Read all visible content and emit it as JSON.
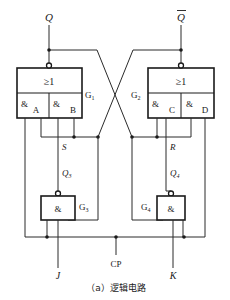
{
  "outputs": {
    "q": "Q",
    "q_bar": "Q"
  },
  "gates": {
    "g1": {
      "label": "G",
      "sub": "1",
      "or_symbol": "≥1",
      "and_left": "&",
      "and_right": "&",
      "input_a": "A",
      "input_b": "B"
    },
    "g2": {
      "label": "G",
      "sub": "2",
      "or_symbol": "≥1",
      "and_left": "&",
      "and_right": "&",
      "input_c": "C",
      "input_d": "D"
    },
    "g3": {
      "label": "G",
      "sub": "3",
      "symbol": "&"
    },
    "g4": {
      "label": "G",
      "sub": "4",
      "symbol": "&"
    }
  },
  "signals": {
    "s": "S",
    "r": "R",
    "q3": "Q",
    "q3_sub": "3",
    "q4": "Q",
    "q4_sub": "4",
    "j": "J",
    "k": "K",
    "cp": "CP"
  },
  "caption": "（a）逻辑电路",
  "colors": {
    "line": "#1a1a1a",
    "background": "#ffffff"
  }
}
